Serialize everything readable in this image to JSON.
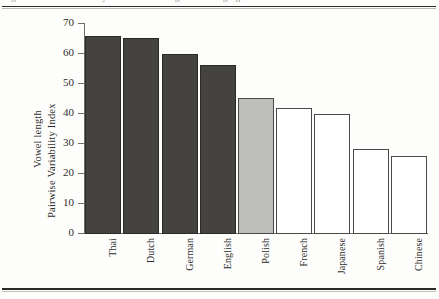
{
  "figure": {
    "caption_partial": "Figure 1. Pairwise Variability Index of vowel length across languages.",
    "rule_color": "#2b2b2b"
  },
  "axes": {
    "y_title_line1": "Vowel length",
    "y_title_line2": "Pairwise Variability Index",
    "x_title": "",
    "y_ticks": [
      "0",
      "10",
      "20",
      "30",
      "40",
      "50",
      "60",
      "70"
    ]
  },
  "chart_data": {
    "type": "bar",
    "title": "",
    "xlabel": "",
    "ylabel": "Vowel length Pairwise Variability Index",
    "ylim": [
      0,
      70
    ],
    "yticks": [
      0,
      10,
      20,
      30,
      40,
      50,
      60,
      70
    ],
    "grid": false,
    "legend": "none",
    "categories": [
      "Thai",
      "Dutch",
      "German",
      "English",
      "Polish",
      "French",
      "Japanese",
      "Spanish",
      "Chinese"
    ],
    "values": [
      66,
      65.5,
      60,
      56.5,
      45.5,
      42,
      40,
      28.5,
      26
    ],
    "bar_styles": [
      "dark",
      "dark",
      "dark",
      "dark",
      "light",
      "white",
      "white",
      "white",
      "white"
    ],
    "colors": {
      "dark": "#454341",
      "light": "#bdbdbb",
      "white": "#ffffff",
      "outline": "#3a3a38"
    }
  }
}
